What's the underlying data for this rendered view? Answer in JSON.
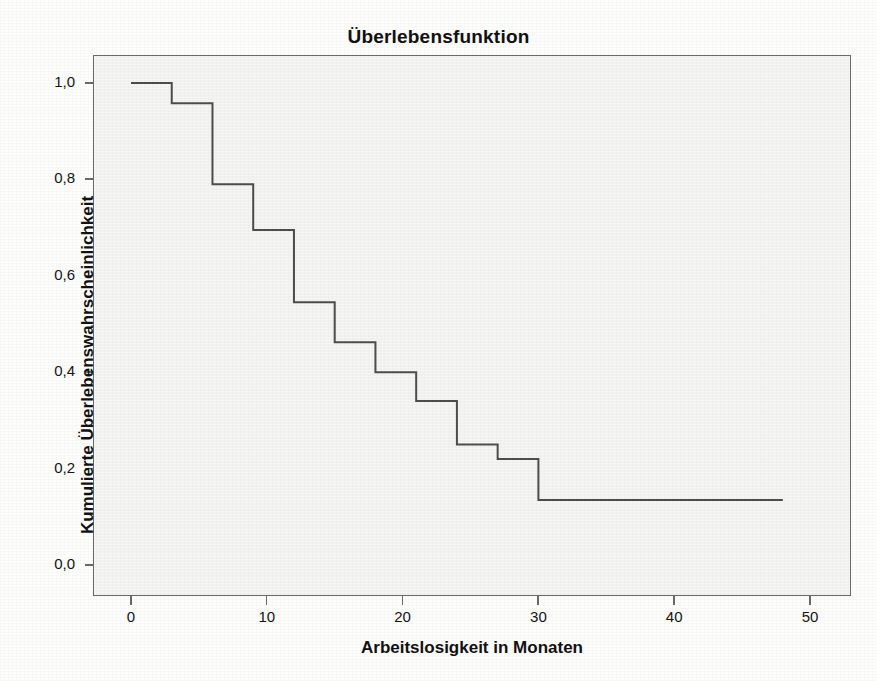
{
  "chart_data": {
    "type": "line",
    "subtype": "kaplan-meier-step",
    "title": "Überlebensfunktion",
    "xlabel": "Arbeitslosigkeit  in Monaten",
    "ylabel": "Kumulierte Überlebenswahrscheinlichkeit",
    "xlim": [
      -2,
      54
    ],
    "ylim": [
      0.0,
      1.05
    ],
    "xticks": [
      0,
      10,
      20,
      30,
      40,
      50
    ],
    "xticklabels": [
      "0",
      "10",
      "20",
      "30",
      "40",
      "50"
    ],
    "yticks": [
      0.0,
      0.2,
      0.4,
      0.6,
      0.8,
      1.0
    ],
    "yticklabels": [
      "0,0",
      "0,2",
      "0,4",
      "0,6",
      "0,8",
      "1,0"
    ],
    "grid": false,
    "legend": null,
    "line_color": "#4d4d4d",
    "plot_background": "#f6f6f4",
    "series": [
      {
        "name": "Überlebensfunktion",
        "x": [
          0,
          3,
          3,
          6,
          6,
          9,
          9,
          12,
          12,
          15,
          15,
          18,
          18,
          21,
          21,
          24,
          24,
          27,
          27,
          30,
          30,
          48
        ],
        "y": [
          1.0,
          1.0,
          0.958,
          0.958,
          0.79,
          0.79,
          0.695,
          0.695,
          0.545,
          0.545,
          0.462,
          0.462,
          0.4,
          0.4,
          0.34,
          0.34,
          0.25,
          0.25,
          0.22,
          0.22,
          0.135,
          0.135
        ],
        "steps": [
          {
            "time": 0,
            "survival": 1.0
          },
          {
            "time": 3,
            "survival": 0.958
          },
          {
            "time": 6,
            "survival": 0.79
          },
          {
            "time": 9,
            "survival": 0.695
          },
          {
            "time": 12,
            "survival": 0.545
          },
          {
            "time": 15,
            "survival": 0.462
          },
          {
            "time": 18,
            "survival": 0.4
          },
          {
            "time": 21,
            "survival": 0.34
          },
          {
            "time": 24,
            "survival": 0.25
          },
          {
            "time": 27,
            "survival": 0.22
          },
          {
            "time": 30,
            "survival": 0.135
          },
          {
            "time": 48,
            "survival": 0.135
          }
        ]
      }
    ]
  },
  "axes": {
    "y_ticks": [
      {
        "label": "1,0",
        "value": 1.0
      },
      {
        "label": "0,8",
        "value": 0.8
      },
      {
        "label": "0,6",
        "value": 0.6
      },
      {
        "label": "0,4",
        "value": 0.4
      },
      {
        "label": "0,2",
        "value": 0.2
      },
      {
        "label": "0,0",
        "value": 0.0
      }
    ],
    "x_ticks": [
      {
        "label": "0",
        "value": 0
      },
      {
        "label": "10",
        "value": 10
      },
      {
        "label": "20",
        "value": 20
      },
      {
        "label": "30",
        "value": 30
      },
      {
        "label": "40",
        "value": 40
      },
      {
        "label": "50",
        "value": 50
      }
    ]
  }
}
